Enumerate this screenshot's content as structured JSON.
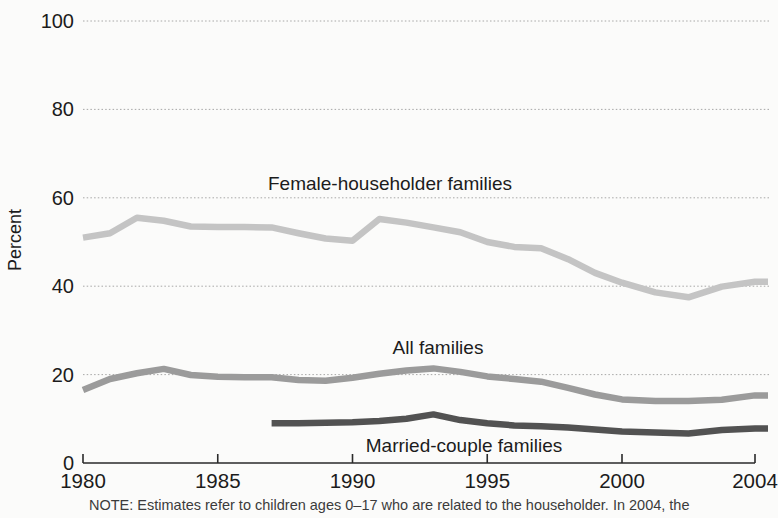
{
  "page": {
    "background": "#fbfbfa"
  },
  "chart_data": {
    "type": "line",
    "title": "",
    "xlabel": "",
    "ylabel": "Percent",
    "ylim": [
      0,
      100
    ],
    "yticks": [
      0,
      20,
      40,
      60,
      80,
      100
    ],
    "xticks": [
      1980,
      1985,
      1990,
      1995,
      2000,
      2004
    ],
    "xlim": [
      1980,
      2004
    ],
    "grid": true,
    "legend_position": "inline-labels",
    "axis_color": "#2a2a2a",
    "grid_color": "#8f8f8f",
    "text_color": "#1c1c1c",
    "note_color": "#3c3c3c",
    "x": [
      1980,
      1981,
      1982,
      1983,
      1984,
      1985,
      1986,
      1987,
      1988,
      1989,
      1990,
      1991,
      1992,
      1993,
      1994,
      1995,
      1996,
      1997,
      1998,
      1999,
      2000,
      2001,
      2002,
      2003,
      2004
    ],
    "series": [
      {
        "name": "Female-householder families",
        "color": "#c4c4c4",
        "label_anchor": {
          "x": 390,
          "y": 184
        },
        "values": [
          51.0,
          52.0,
          55.5,
          54.8,
          53.5,
          53.4,
          53.4,
          53.3,
          52.0,
          50.8,
          50.3,
          55.2,
          54.4,
          53.3,
          52.2,
          50.0,
          48.9,
          48.6,
          46.1,
          43.0,
          40.8,
          38.6,
          37.5,
          39.9,
          41.0
        ]
      },
      {
        "name": "All families",
        "color": "#9b9b9b",
        "label_anchor": {
          "x": 438,
          "y": 348
        },
        "values": [
          16.5,
          19.0,
          20.3,
          21.3,
          19.9,
          19.5,
          19.4,
          19.4,
          18.8,
          18.6,
          19.3,
          20.2,
          20.9,
          21.4,
          20.6,
          19.6,
          19.0,
          18.4,
          17.0,
          15.5,
          14.4,
          14.0,
          14.0,
          14.3,
          15.3
        ]
      },
      {
        "name": "Married-couple families",
        "color": "#525252",
        "label_anchor": {
          "x": 464,
          "y": 446
        },
        "values": [
          null,
          null,
          null,
          null,
          null,
          null,
          null,
          9.0,
          9.0,
          9.1,
          9.2,
          9.5,
          10.0,
          11.0,
          9.7,
          9.0,
          8.5,
          8.3,
          8.0,
          7.6,
          7.1,
          6.9,
          6.7,
          7.5,
          7.8
        ]
      }
    ],
    "note": "NOTE: Estimates refer to children ages 0–17 who are related to the householder. In 2004, the"
  }
}
